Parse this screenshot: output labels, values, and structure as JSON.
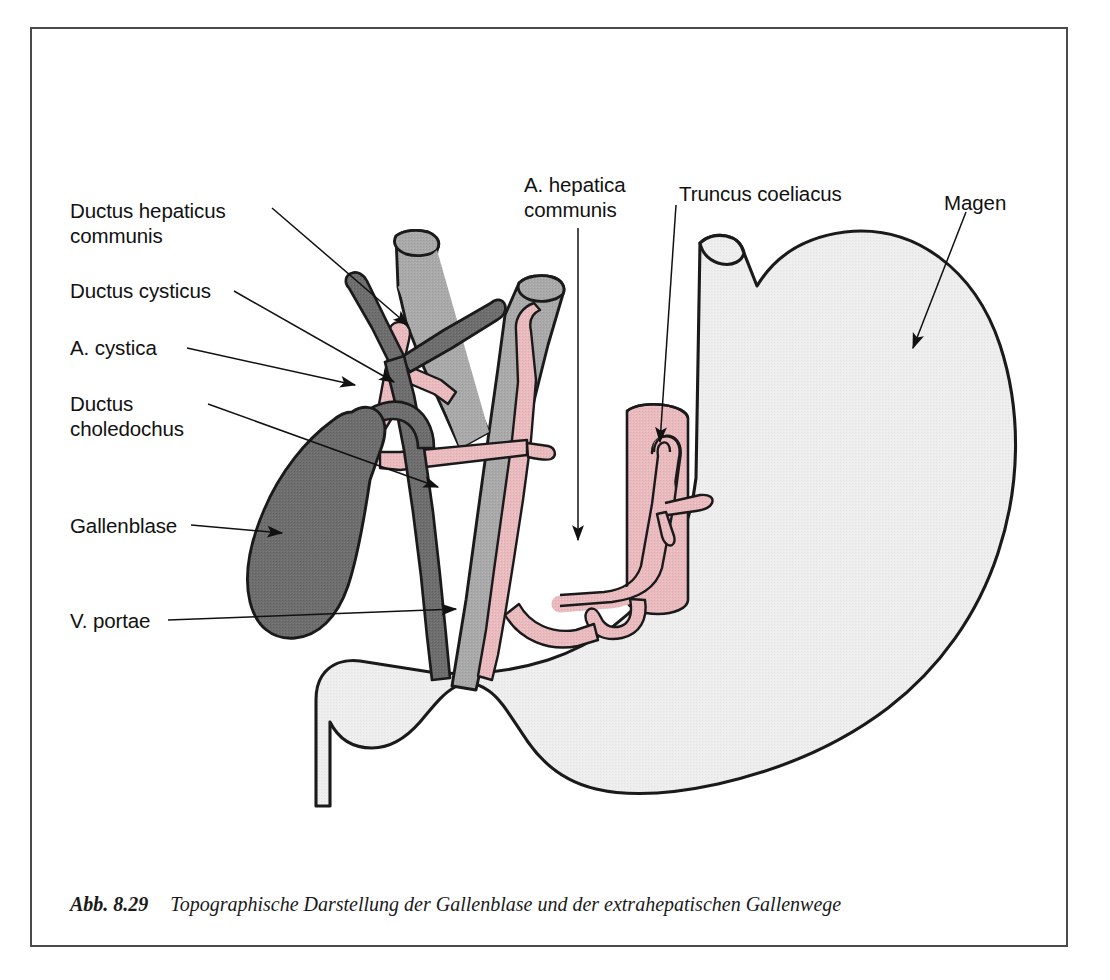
{
  "figure": {
    "number": "Abb. 8.29",
    "caption": "Topographische Darstellung der Gallenblase und der extrahepatischen Gallenwege",
    "type": "anatomical-diagram"
  },
  "colors": {
    "bile_duct_dark_gray": "#6e6e6e",
    "gallbladder_dark_gray": "#6e6e6e",
    "portal_vein_gray": "#a8a8a8",
    "artery_pink": "#e8b8bc",
    "stomach_light_gray": "#ececec",
    "outline_black": "#1a1a1a",
    "frame_gray": "#4a4a4a",
    "page_white": "#ffffff"
  },
  "labels": [
    {
      "id": "ductus-hepaticus-communis",
      "line1": "Ductus hepaticus",
      "line2": "communis",
      "x": 70,
      "y": 198
    },
    {
      "id": "ductus-cysticus",
      "line1": "Ductus cysticus",
      "line2": "",
      "x": 70,
      "y": 278
    },
    {
      "id": "a-cystica",
      "line1": "A. cystica",
      "line2": "",
      "x": 70,
      "y": 335
    },
    {
      "id": "ductus-choledochus",
      "line1": "Ductus",
      "line2": "choledochus",
      "x": 70,
      "y": 391
    },
    {
      "id": "gallenblase",
      "line1": "Gallenblase",
      "line2": "",
      "x": 70,
      "y": 513
    },
    {
      "id": "v-portae",
      "line1": "V. portae",
      "line2": "",
      "x": 70,
      "y": 608
    },
    {
      "id": "a-hepatica-communis",
      "line1": "A. hepatica",
      "line2": "communis",
      "x": 524,
      "y": 172
    },
    {
      "id": "truncus-coeliacus",
      "line1": "Truncus coeliacus",
      "line2": "",
      "x": 679,
      "y": 181
    },
    {
      "id": "magen",
      "line1": "Magen",
      "line2": "",
      "x": 944,
      "y": 190
    }
  ],
  "structures": [
    {
      "id": "gallenblase",
      "name": "Gallenblase",
      "kind": "organ",
      "fill": "dark-gray"
    },
    {
      "id": "ductus-cysticus",
      "name": "Ductus cysticus",
      "kind": "duct",
      "fill": "dark-gray"
    },
    {
      "id": "ductus-hepaticus",
      "name": "Ductus hepaticus communis",
      "kind": "duct",
      "fill": "dark-gray"
    },
    {
      "id": "ductus-choledochus",
      "name": "Ductus choledochus",
      "kind": "duct",
      "fill": "dark-gray"
    },
    {
      "id": "v-portae",
      "name": "V. portae",
      "kind": "vein",
      "fill": "mid-gray"
    },
    {
      "id": "a-cystica",
      "name": "A. cystica",
      "kind": "artery",
      "fill": "pink"
    },
    {
      "id": "a-hepatica-communis",
      "name": "A. hepatica communis",
      "kind": "artery",
      "fill": "pink"
    },
    {
      "id": "truncus-coeliacus",
      "name": "Truncus coeliacus",
      "kind": "artery",
      "fill": "pink"
    },
    {
      "id": "aorta",
      "name": "Aorta",
      "kind": "artery",
      "fill": "pink"
    },
    {
      "id": "magen",
      "name": "Magen",
      "kind": "organ",
      "fill": "light-gray"
    }
  ]
}
